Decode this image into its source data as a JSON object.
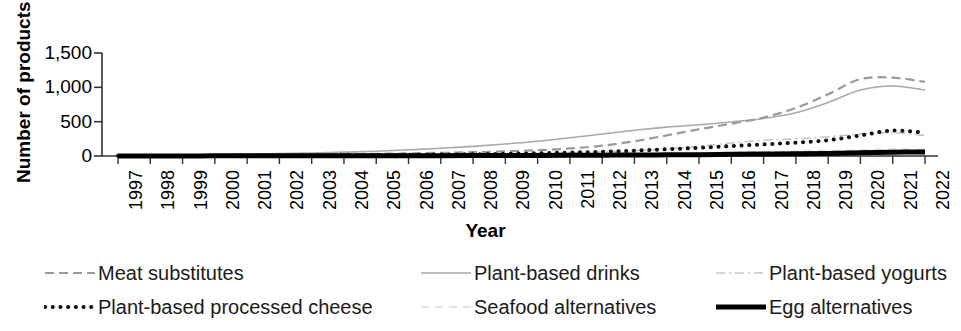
{
  "chart_data": {
    "type": "line",
    "title": "",
    "xlabel": "Year",
    "ylabel": "Number of products",
    "grid": false,
    "legend_position": "bottom",
    "xlim": [
      1997,
      2022
    ],
    "ylim": [
      0,
      1500
    ],
    "yticks": [
      "0",
      "500",
      "1,000",
      "1,500"
    ],
    "ytick_values": [
      0,
      500,
      1000,
      1500
    ],
    "categories": [
      "1997",
      "1998",
      "1999",
      "2000",
      "2001",
      "2002",
      "2003",
      "2004",
      "2005",
      "2006",
      "2007",
      "2008",
      "2009",
      "2010",
      "2011",
      "2012",
      "2013",
      "2014",
      "2015",
      "2016",
      "2017",
      "2018",
      "2019",
      "2020",
      "2021",
      "2022"
    ],
    "series": [
      {
        "name": "Meat substitutes",
        "style": "dashed",
        "color": "#9a9a9a",
        "width": 2.2,
        "values": [
          4,
          6,
          8,
          10,
          13,
          16,
          20,
          25,
          30,
          38,
          46,
          55,
          68,
          84,
          110,
          150,
          215,
          300,
          390,
          470,
          560,
          700,
          900,
          1120,
          1140,
          1080
        ]
      },
      {
        "name": "Plant-based drinks",
        "style": "solid",
        "color": "#aaaaaa",
        "width": 1.6,
        "values": [
          6,
          10,
          14,
          20,
          26,
          34,
          44,
          56,
          70,
          90,
          112,
          140,
          175,
          215,
          265,
          320,
          375,
          420,
          455,
          495,
          545,
          630,
          780,
          960,
          1020,
          960
        ]
      },
      {
        "name": "Plant-based yogurts",
        "style": "dashdot",
        "color": "#c6c6c6",
        "width": 1.6,
        "values": [
          2,
          3,
          4,
          5,
          6,
          8,
          10,
          12,
          15,
          18,
          22,
          27,
          33,
          40,
          50,
          62,
          80,
          105,
          140,
          190,
          230,
          250,
          280,
          320,
          340,
          300
        ]
      },
      {
        "name": "Plant-based processed cheese",
        "style": "dotted",
        "color": "#111111",
        "width": 4.0,
        "values": [
          2,
          3,
          4,
          5,
          6,
          7,
          9,
          11,
          14,
          17,
          21,
          26,
          32,
          40,
          50,
          62,
          78,
          98,
          120,
          145,
          170,
          195,
          230,
          300,
          370,
          340
        ]
      },
      {
        "name": "Seafood alternatives",
        "style": "dashed-light",
        "color": "#dcdcdc",
        "width": 1.6,
        "values": [
          1,
          1,
          2,
          2,
          3,
          3,
          4,
          5,
          6,
          7,
          9,
          11,
          13,
          16,
          20,
          24,
          30,
          36,
          44,
          52,
          60,
          68,
          78,
          90,
          100,
          95
        ]
      },
      {
        "name": "Egg alternatives",
        "style": "solid-thick",
        "color": "#000000",
        "width": 5.0,
        "values": [
          1,
          1,
          1,
          2,
          2,
          2,
          3,
          3,
          4,
          4,
          5,
          6,
          7,
          8,
          10,
          12,
          14,
          17,
          20,
          24,
          28,
          32,
          38,
          46,
          55,
          60
        ]
      }
    ]
  },
  "axis": {
    "y_title": "Number of products",
    "x_title": "Year"
  },
  "legend": {
    "items": [
      {
        "label": "Meat substitutes",
        "key": "dashed-line-key"
      },
      {
        "label": "Plant-based drinks",
        "key": "solid-gray-line-key"
      },
      {
        "label": "Plant-based yogurts",
        "key": "dashdot-line-key"
      },
      {
        "label": "Plant-based processed cheese",
        "key": "dotted-line-key"
      },
      {
        "label": "Seafood alternatives",
        "key": "light-dashed-line-key"
      },
      {
        "label": "Egg alternatives",
        "key": "solid-black-thick-line-key"
      }
    ]
  }
}
